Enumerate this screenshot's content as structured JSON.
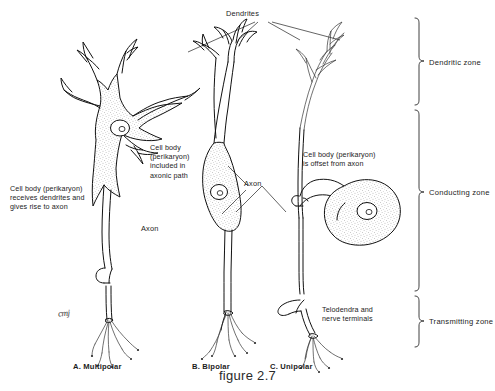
{
  "figure": {
    "caption": "figure 2.7",
    "artist_signature": "cmj"
  },
  "top_label": {
    "dendrites": "Dendrites"
  },
  "annotations": {
    "multipolar_soma": "Cell body (perikaryon)\nreceives dendrites and\ngives rise to axon",
    "bipolar_soma": "Cell body\n(perikaryon)\nincluded in\naxonic path",
    "unipolar_soma": "Cell body (perikaryon)\nis offset from axon",
    "telodendra": "Telodendra and\nnerve terminals",
    "axon_multipolar": "Axon",
    "axon_bipolar": "Axon"
  },
  "zones": [
    {
      "name": "dendritic",
      "label": "Dendritic zone"
    },
    {
      "name": "conducting",
      "label": "Conducting zone"
    },
    {
      "name": "transmitting",
      "label": "Transmitting zone"
    }
  ],
  "panels": [
    {
      "key": "a",
      "label": "A.  Multipolar"
    },
    {
      "key": "b",
      "label": "B.  Bipolar"
    },
    {
      "key": "c",
      "label": "C.  Unipolar"
    }
  ],
  "colors": {
    "ink": "#111111",
    "cytoplasm_fill": "#f2f1ee",
    "background": "#ffffff",
    "text": "#1c1c1c"
  }
}
